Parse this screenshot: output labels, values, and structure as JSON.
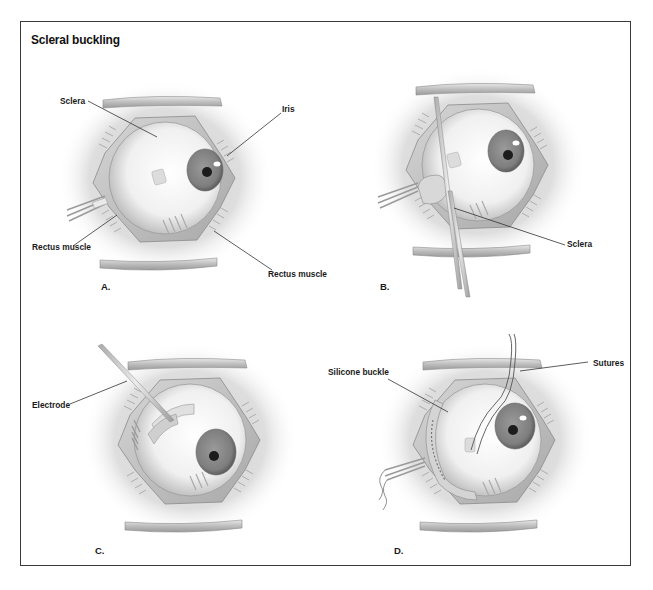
{
  "figure": {
    "title": "Scleral buckling",
    "palette": {
      "frame": "#3a3a3a",
      "halo": "#d9d9d9",
      "retractor": "#c8c8c8",
      "sclera": "#f4f4f4",
      "iris": "#8a8a8a",
      "pupil": "#1c1c1c",
      "leader_line": "#333333"
    },
    "panels": [
      {
        "id": "A",
        "panel_label": "A.",
        "labels": [
          {
            "text": "Sclera"
          },
          {
            "text": "Iris"
          },
          {
            "text": "Rectus muscle"
          },
          {
            "text": "Rectus muscle"
          }
        ]
      },
      {
        "id": "B",
        "panel_label": "B.",
        "labels": [
          {
            "text": "Sclera"
          }
        ]
      },
      {
        "id": "C",
        "panel_label": "C.",
        "labels": [
          {
            "text": "Electrode"
          }
        ]
      },
      {
        "id": "D",
        "panel_label": "D.",
        "labels": [
          {
            "text": "Silicone buckle"
          },
          {
            "text": "Sutures"
          }
        ]
      }
    ]
  }
}
